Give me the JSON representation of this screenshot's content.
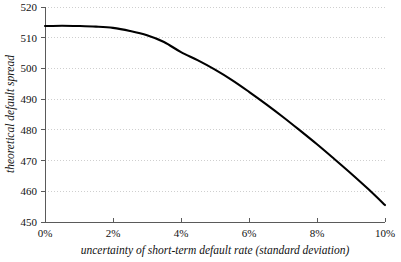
{
  "chart_data": {
    "type": "line",
    "title": "",
    "xlabel": "uncertainty of short-term default rate (standard deviation)",
    "ylabel": "theoretical default spread",
    "xlim": [
      0,
      10
    ],
    "ylim": [
      450,
      520
    ],
    "grid": true,
    "grid_axis": "y",
    "legend": "none",
    "x_tick_labels": [
      "0%",
      "2%",
      "4%",
      "6%",
      "8%",
      "10%"
    ],
    "x_tick_values": [
      0,
      2,
      4,
      6,
      8,
      10
    ],
    "y_tick_labels": [
      "450",
      "460",
      "470",
      "480",
      "490",
      "500",
      "510",
      "520"
    ],
    "y_tick_values": [
      450,
      460,
      470,
      480,
      490,
      500,
      510,
      520
    ],
    "series": [
      {
        "name": "theoretical default spread",
        "color": "#000000",
        "x": [
          0,
          0.5,
          1,
          1.5,
          2,
          2.5,
          3,
          3.5,
          4,
          4.5,
          5,
          5.5,
          6,
          6.5,
          7,
          7.5,
          8,
          8.5,
          9,
          9.5,
          10
        ],
        "values": [
          513.8,
          513.9,
          513.8,
          513.6,
          513.2,
          512.2,
          510.8,
          508.6,
          505.3,
          502.6,
          499.6,
          496.2,
          492.4,
          488.4,
          484.2,
          479.8,
          475.3,
          470.6,
          465.8,
          460.8,
          455.5
        ]
      }
    ]
  },
  "axes": {
    "y_title": "theoretical default spread",
    "x_title": "uncertainty of short-term default rate (standard deviation)"
  }
}
